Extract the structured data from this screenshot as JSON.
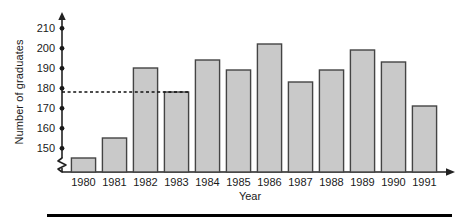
{
  "chart_data": {
    "type": "bar",
    "title": "",
    "xlabel": "Year",
    "ylabel": "Number of graduates",
    "categories": [
      "1980",
      "1981",
      "1982",
      "1983",
      "1984",
      "1985",
      "1986",
      "1987",
      "1988",
      "1989",
      "1990",
      "1991"
    ],
    "values": [
      152,
      162,
      197,
      185,
      201,
      196,
      209,
      190,
      196,
      206,
      200,
      178
    ],
    "ylim": [
      145,
      214
    ],
    "yticks": [
      150,
      160,
      170,
      180,
      190,
      200,
      210
    ],
    "ytick_labels": [
      "150",
      "160",
      "170",
      "180",
      "190",
      "200",
      "210"
    ],
    "grid": false,
    "legend": null,
    "axis_break": true,
    "annotations": [
      {
        "type": "reference-line",
        "style": "dashed",
        "value": 185,
        "label": ""
      }
    ],
    "colors": {
      "bar_fill": "#c9c9c9",
      "bar_edge": "#444444",
      "axis": "#222222",
      "text": "#1a1a1a",
      "reference_line": "#111111",
      "bottom_rule": "#000000"
    }
  },
  "figure": {
    "y_axis_label": "Number of graduates",
    "x_axis_label": "Year"
  }
}
